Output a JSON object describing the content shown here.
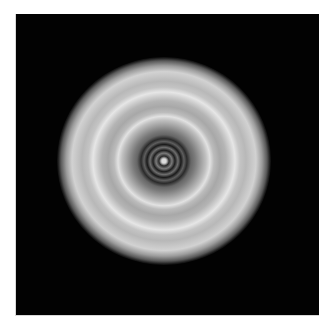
{
  "image": {
    "description": "Grayscale concentric ring (interference/diffraction) pattern on black square background",
    "background_color": "#020202",
    "page_color": "#ffffff",
    "frame": {
      "x": 15,
      "y": 14,
      "width": 304,
      "height": 302
    },
    "disc": {
      "center": [
        163,
        161
      ],
      "radius_x": 107,
      "radius_y": 104,
      "inner_dark_rings": 4,
      "central_spot_color": "#dcdcdc",
      "outer_bright_rings": 2
    }
  }
}
